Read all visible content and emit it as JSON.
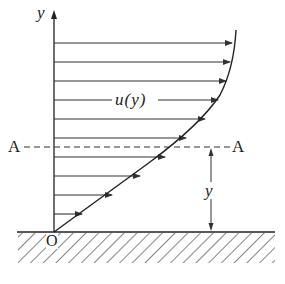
{
  "diagram": {
    "labels": {
      "y_axis": "y",
      "profile": "u(y)",
      "section_left": "A",
      "section_right": "A",
      "distance": "y",
      "origin": "O"
    },
    "arrow_rows_y": [
      43,
      62,
      81,
      100,
      119,
      138,
      157,
      176,
      195,
      214
    ],
    "colors": {
      "line": "#222222",
      "background": "#ffffff"
    }
  }
}
